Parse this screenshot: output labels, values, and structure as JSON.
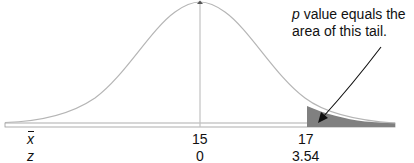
{
  "diagram": {
    "type": "normal-distribution-right-tail",
    "annotation": {
      "p_symbol": "p",
      "line1_rest": " value equals the",
      "line2": "area of this tail."
    },
    "axis_rows": [
      {
        "name": "x",
        "name_display": "x̄",
        "values": [
          "15",
          "17"
        ]
      },
      {
        "name": "z",
        "name_display": "z",
        "values": [
          "0",
          "3.54"
        ]
      }
    ],
    "mean": {
      "x_label": "15",
      "z_label": "0"
    },
    "cutoff": {
      "x_label": "17",
      "z_label": "3.54"
    },
    "colors": {
      "curve": "#b5b5b5",
      "tail_fill": "#808080",
      "axis": "#9a9a9a",
      "arrow": "#111111",
      "text": "#111111"
    }
  }
}
